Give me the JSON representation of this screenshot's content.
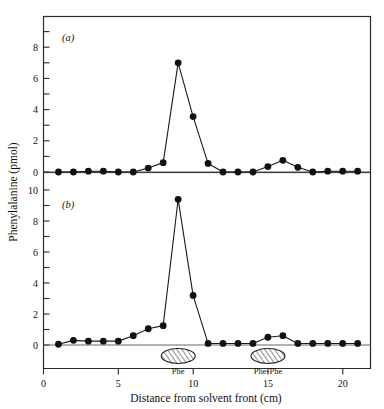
{
  "figure": {
    "background_color": "#ffffff",
    "line_color": "#1a1a1a",
    "marker_color": "#111111",
    "frame_color": "#2b2b2b"
  },
  "axis": {
    "y_label": "Phenylalanine (pmol)",
    "x_label": "Distance from solvent front (cm)"
  },
  "panels": {
    "a": {
      "label": "(a)"
    },
    "b": {
      "label": "(b)"
    }
  },
  "spots": [
    {
      "name": "Phe",
      "label": "Phe",
      "center_x": 9.0,
      "width_cm": 1.55
    },
    {
      "name": "Phe-Phe",
      "label": "Phe-Phe",
      "center_x": 15.0,
      "width_cm": 1.55
    }
  ],
  "chart_data": [
    {
      "type": "line",
      "panel": "a",
      "title": "(a)",
      "xlabel": "Distance from solvent front (cm)",
      "ylabel": "Phenylalanine (pmol)",
      "xlim": [
        0,
        21.8
      ],
      "ylim": [
        -0.45,
        10.2
      ],
      "xticks": [
        0,
        5,
        10,
        15,
        20
      ],
      "yticks": [
        0,
        2,
        4,
        6,
        8
      ],
      "ytick_labels": [
        "0",
        "2",
        "4",
        "6",
        "8"
      ],
      "grid": false,
      "legend": "none",
      "marker": "filled-circle",
      "x": [
        1,
        2,
        3,
        4,
        5,
        6,
        7,
        8,
        9,
        10,
        11,
        12,
        13,
        14,
        15,
        16,
        17,
        18,
        19,
        20,
        21
      ],
      "values": [
        0.0,
        0.0,
        0.05,
        0.05,
        0.0,
        0.0,
        0.25,
        0.6,
        7.0,
        3.55,
        0.55,
        0.0,
        0.0,
        0.0,
        0.35,
        0.75,
        0.3,
        0.0,
        0.05,
        0.05,
        0.05
      ]
    },
    {
      "type": "line",
      "panel": "b",
      "title": "(b)",
      "xlabel": "Distance from solvent front (cm)",
      "ylabel": "Phenylalanine (pmol)",
      "xlim": [
        0,
        21.8
      ],
      "ylim": [
        -0.9,
        10.6
      ],
      "xticks": [
        0,
        5,
        10,
        15,
        20
      ],
      "yticks": [
        0,
        2,
        4,
        6,
        8,
        10
      ],
      "ytick_labels": [
        "0",
        "2",
        "4",
        "6",
        "8",
        "10"
      ],
      "grid": false,
      "legend": "none",
      "marker": "filled-circle",
      "x": [
        1,
        2,
        3,
        4,
        5,
        6,
        7,
        8,
        9,
        10,
        11,
        12,
        13,
        14,
        15,
        16,
        17,
        18,
        19,
        20,
        21
      ],
      "values": [
        0.05,
        0.3,
        0.25,
        0.25,
        0.25,
        0.6,
        1.05,
        1.25,
        9.4,
        3.2,
        0.1,
        0.1,
        0.1,
        0.1,
        0.5,
        0.6,
        0.1,
        0.1,
        0.1,
        0.1,
        0.1
      ]
    }
  ]
}
